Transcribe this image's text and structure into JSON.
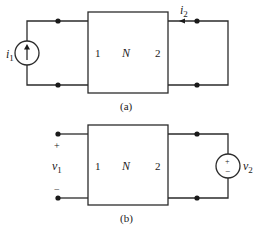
{
  "figure_a": {
    "caption": "(a)",
    "network_label": "N",
    "port1_label": "1",
    "port2_label": "2",
    "source": {
      "type": "current-source",
      "symbol": "i",
      "subscript": "1",
      "direction": "up"
    },
    "port2_current": {
      "symbol": "i",
      "subscript": "2",
      "direction": "left"
    },
    "port2_termination": "short-circuit"
  },
  "figure_b": {
    "caption": "(b)",
    "network_label": "N",
    "port1_label": "1",
    "port2_label": "2",
    "port1_voltage": {
      "symbol": "v",
      "subscript": "1",
      "plus": "+",
      "minus": "−"
    },
    "source": {
      "type": "voltage-source",
      "symbol": "v",
      "subscript": "2",
      "plus": "+",
      "minus": "−"
    },
    "port1_termination": "open-circuit"
  },
  "colors": {
    "line": "#2b2b2b",
    "background": "#ffffff"
  }
}
